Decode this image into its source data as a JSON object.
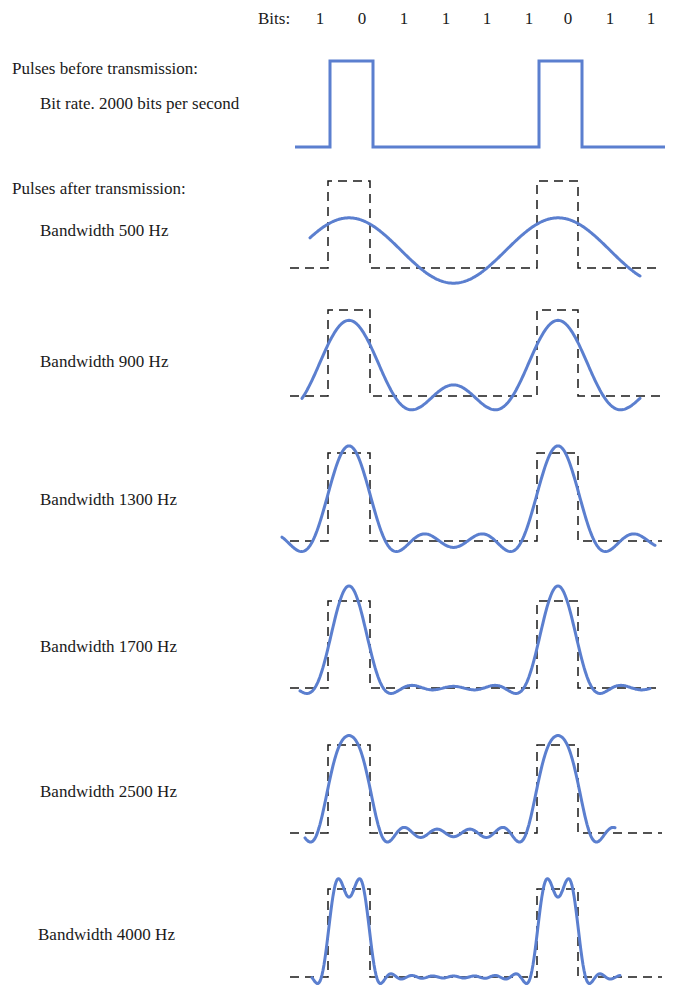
{
  "header": {
    "bits_label": "Bits:",
    "bits": [
      "1",
      "0",
      "1",
      "1",
      "1",
      "1",
      "0",
      "1",
      "1"
    ]
  },
  "labels": {
    "before_title": "Pulses before transmission:",
    "bit_rate": "Bit rate. 2000 bits per second",
    "after_title": "Pulses after transmission:"
  },
  "panels": [
    {
      "label": "Bandwidth 500 Hz",
      "harmonics": 1,
      "top": 181,
      "base": 268,
      "label_y": 222,
      "curve_x": [
        310,
        640
      ]
    },
    {
      "label": "Bandwidth 900 Hz",
      "harmonics": 2,
      "top": 310,
      "base": 396,
      "label_y": 353,
      "curve_x": [
        302,
        640
      ]
    },
    {
      "label": "Bandwidth 1300 Hz",
      "harmonics": 3,
      "top": 453,
      "base": 541,
      "label_y": 491,
      "curve_x": [
        282,
        655
      ]
    },
    {
      "label": "Bandwidth 1700 Hz",
      "harmonics": 4,
      "top": 601,
      "base": 688,
      "label_y": 638,
      "curve_x": [
        300,
        650
      ]
    },
    {
      "label": "Bandwidth 2500 Hz",
      "harmonics": 6,
      "top": 745,
      "base": 833,
      "label_y": 783,
      "curve_x": [
        305,
        615
      ]
    },
    {
      "label": "Bandwidth 4000 Hz",
      "harmonics": 10,
      "top": 889,
      "base": 977,
      "label_y": 926,
      "curve_x": [
        312,
        620
      ]
    }
  ],
  "chart_data": {
    "type": "line",
    "bits": [
      1,
      0,
      1,
      1,
      1,
      1,
      0,
      1,
      1
    ],
    "bit_rate_bps": 2000,
    "series": [
      {
        "name": "Pulses before transmission",
        "style": "solid",
        "values": [
          0,
          1,
          0,
          0,
          0,
          0,
          1,
          0,
          0
        ]
      },
      {
        "name": "Bandwidth 500 Hz",
        "harmonics_kept": 1
      },
      {
        "name": "Bandwidth 900 Hz",
        "harmonics_kept": 2
      },
      {
        "name": "Bandwidth 1300 Hz",
        "harmonics_kept": 3
      },
      {
        "name": "Bandwidth 1700 Hz",
        "harmonics_kept": 4
      },
      {
        "name": "Bandwidth 2500 Hz",
        "harmonics_kept": 6
      },
      {
        "name": "Bandwidth 4000 Hz",
        "harmonics_kept": 10
      }
    ],
    "xlabel": "",
    "ylabel": "",
    "grid": false,
    "legend": "row labels at left"
  },
  "colors": {
    "signal": "#5b7fcf",
    "reference": "#1a1a1a",
    "text": "#1a1a1a"
  }
}
